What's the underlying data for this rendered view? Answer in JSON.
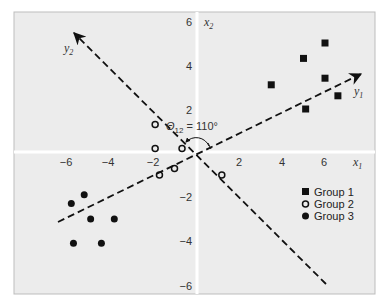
{
  "chart_data": {
    "type": "scatter",
    "title": "",
    "xlabel": "x1",
    "ylabel": "x2",
    "xlim": [
      -6.5,
      8.3
    ],
    "ylim": [
      -6.4,
      6.5
    ],
    "x_ticks": [
      -6,
      -4,
      -2,
      2,
      4,
      6
    ],
    "y_ticks": [
      6,
      4,
      2,
      -2,
      -4,
      -6
    ],
    "grid": false,
    "legend_position": "lower right",
    "series": [
      {
        "name": "Group 1",
        "marker": "filled-square",
        "points": [
          [
            3.5,
            3.1
          ],
          [
            5.0,
            4.3
          ],
          [
            6.0,
            5.0
          ],
          [
            6.0,
            3.4
          ],
          [
            6.6,
            2.6
          ],
          [
            5.1,
            2.0
          ]
        ]
      },
      {
        "name": "Group 2",
        "marker": "open-circle",
        "points": [
          [
            -1.9,
            1.3
          ],
          [
            -1.9,
            0.2
          ],
          [
            -0.65,
            0.2
          ],
          [
            -1.7,
            -1.0
          ],
          [
            -1.0,
            -0.7
          ],
          [
            1.2,
            -1.0
          ]
        ]
      },
      {
        "name": "Group 3",
        "marker": "filled-circle",
        "points": [
          [
            -5.8,
            -2.3
          ],
          [
            -5.2,
            -1.9
          ],
          [
            -4.9,
            -3.0
          ],
          [
            -3.8,
            -3.0
          ],
          [
            -5.7,
            -4.1
          ],
          [
            -4.4,
            -4.1
          ]
        ]
      }
    ],
    "rotated_axes": [
      {
        "name": "y1",
        "from": [
          -6.4,
          -3.1
        ],
        "to": [
          7.7,
          3.6
        ]
      },
      {
        "name": "y2",
        "from": [
          6.0,
          -5.9
        ],
        "to": [
          -5.7,
          5.4
        ]
      }
    ],
    "annotations": [
      {
        "text": "Θ12 = 110°",
        "description": "angle between rotated axes y1 and y2"
      }
    ]
  },
  "labels": {
    "x_axis": "x",
    "x_axis_sub": "1",
    "y_axis": "x",
    "y_axis_sub": "2",
    "y1": "y",
    "y1_sub": "1",
    "y2": "y",
    "y2_sub": "2",
    "theta": "Θ",
    "theta_sub": "12",
    "theta_value": " = 110°"
  },
  "ticks": {
    "x": [
      {
        "label": "−6",
        "px": 66
      },
      {
        "label": "−4",
        "px": 108
      },
      {
        "label": "−2",
        "px": 153
      },
      {
        "label": "2",
        "px": 239
      },
      {
        "label": "4",
        "px": 282
      },
      {
        "label": "6",
        "px": 324
      }
    ],
    "y": [
      {
        "label": "6",
        "py": 22
      },
      {
        "label": "4",
        "py": 66
      },
      {
        "label": "2",
        "py": 110
      },
      {
        "label": "−2",
        "py": 197
      },
      {
        "label": "−4",
        "py": 241
      },
      {
        "label": "−6",
        "py": 286
      }
    ]
  },
  "legend": [
    {
      "label": "Group 1",
      "marker": "filled-square"
    },
    {
      "label": "Group 2",
      "marker": "open-circle"
    },
    {
      "label": "Group 3",
      "marker": "filled-circle"
    }
  ],
  "colors": {
    "plot_bg": "#ececec",
    "frame": "#bdbdbd",
    "axis_line": "#ffffff",
    "marker": "#111111",
    "dashed_line": "#111111"
  }
}
